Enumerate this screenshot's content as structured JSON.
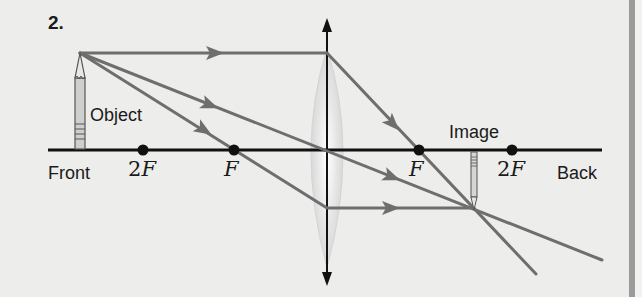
{
  "diagram": {
    "problem_number": "2.",
    "labels": {
      "object": "Object",
      "image": "Image",
      "front": "Front",
      "back": "Back",
      "two_f_left_num": "2",
      "two_f_left_letter": "F",
      "f_left": "F",
      "f_right": "F",
      "two_f_right_num": "2",
      "two_f_right_letter": "F"
    },
    "colors": {
      "background": "#ededeb",
      "axis": "#111111",
      "rays": "#6e6e6e",
      "lens_fill": "#dcdcdc",
      "border": "#9b9b9b"
    },
    "geometry": {
      "axis_y": 150,
      "axis_x_start": 48,
      "axis_x_end": 602,
      "lens_x": 327,
      "focal_points_x": [
        143,
        234,
        419,
        512
      ],
      "object_x": 80,
      "object_tip_y": 53,
      "image_x": 474,
      "image_tip_y": 209
    }
  }
}
